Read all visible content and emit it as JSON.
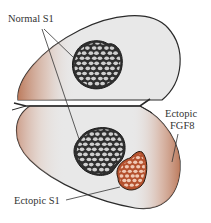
{
  "labels": {
    "normal_s1": "Normal S1",
    "ectopic_fgf8_line1": "Ectopic",
    "ectopic_fgf8_line2": "FGF8",
    "ectopic_s1": "Ectopic S1"
  },
  "colors": {
    "background": "#ffffff",
    "cortex_fill": "#e8e8e8",
    "outline": "#2a2a2a",
    "normal_s1_fill": "#2f2f2f",
    "barrel_fill": "#cfcfcf",
    "ectopic_s1_fill": "#b4512e",
    "ectopic_barrel_fill": "#f0c9b5",
    "fgf8_gradient": "#c27a5a",
    "text": "#333333"
  }
}
